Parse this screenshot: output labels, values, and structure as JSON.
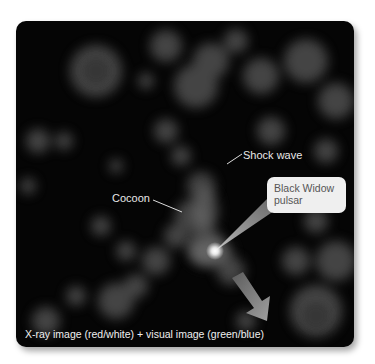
{
  "figure": {
    "caption": "X-ray image (red/white) + visual image (green/blue)",
    "labels": {
      "shock_wave": "Shock wave",
      "cocoon": "Cocoon",
      "pulsar_line1": "Black Widow",
      "pulsar_line2": "pulsar"
    },
    "icons": {
      "motion_arrow": "arrow-down-right",
      "pulsar_star": "bright-star"
    },
    "colors": {
      "background": "#050505",
      "nebula": "#5a5a5a",
      "callout_fill": "#efefef",
      "callout_text": "#555555",
      "label_text": "#e8e8e8",
      "arrow": "#8a8a8a"
    }
  }
}
